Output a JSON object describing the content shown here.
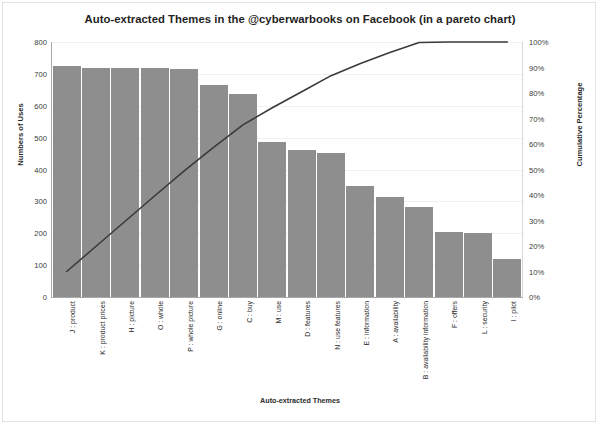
{
  "chart_data": {
    "type": "bar",
    "title": "Auto-extracted Themes in the @cyberwarbooks on Facebook (in a pareto chart)",
    "xlabel": "Auto-extracted Themes",
    "ylabel": "Numbers of Uses",
    "y2label": "Cumulative Percentage",
    "categories": [
      "J : product",
      "K : product prices",
      "H : picture",
      "O : whole",
      "P : whole picture",
      "G : online",
      "C : buy",
      "M : use",
      "D : features",
      "N : use features",
      "E : information",
      "A : availability",
      "B : availability information",
      "F : offers",
      "L : security",
      "I : pilot"
    ],
    "series": [
      {
        "name": "Numbers of Uses",
        "type": "bar",
        "values": [
          725,
          718,
          718,
          718,
          715,
          665,
          638,
          485,
          460,
          452,
          348,
          315,
          282,
          205,
          200,
          120
        ]
      },
      {
        "name": "Cumulative Percentage",
        "type": "line",
        "axis": "right",
        "values": [
          10.0,
          19.9,
          29.8,
          39.7,
          49.5,
          58.7,
          67.5,
          74.2,
          80.5,
          86.8,
          91.6,
          95.9,
          99.8,
          100.0,
          100.0,
          100.0
        ]
      }
    ],
    "ylim": [
      0,
      800
    ],
    "yticks": [
      "0",
      "100",
      "200",
      "300",
      "400",
      "500",
      "600",
      "700",
      "800"
    ],
    "y2lim": [
      0,
      100
    ],
    "y2ticks": [
      "0%",
      "10%",
      "20%",
      "30%",
      "40%",
      "50%",
      "60%",
      "70%",
      "80%",
      "90%",
      "100%"
    ],
    "grid": true,
    "legend": "none",
    "bar_color": "#8e8e8e",
    "line_color": "#3a3a3a",
    "grid_color": "#f0f0f0"
  }
}
